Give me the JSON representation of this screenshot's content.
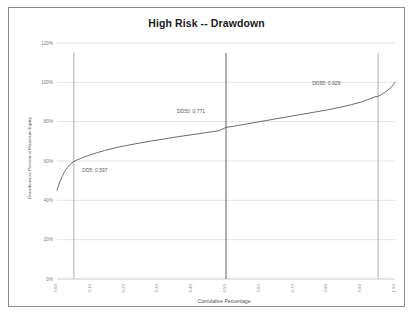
{
  "chart_data": {
    "type": "line",
    "title": "High Risk -- Drawdown",
    "xlabel": "Cumulative Percentage",
    "ylabel": "Drawdown as Percent of Maximum Equity",
    "xlim": [
      0.0,
      1.0
    ],
    "ylim": [
      0.0,
      1.2
    ],
    "grid": true,
    "legend": false,
    "xticks": [
      "0.00",
      "0.10",
      "0.20",
      "0.30",
      "0.40",
      "0.50",
      "0.60",
      "0.70",
      "0.80",
      "0.90",
      "1.00"
    ],
    "xtick_values": [
      0.0,
      0.1,
      0.2,
      0.3,
      0.4,
      0.5,
      0.6,
      0.7,
      0.8,
      0.9,
      1.0
    ],
    "yticks": [
      "0%",
      "20%",
      "40%",
      "60%",
      "80%",
      "100%",
      "120%"
    ],
    "ytick_values": [
      0.0,
      0.2,
      0.4,
      0.6,
      0.8,
      1.0,
      1.2
    ],
    "series": [
      {
        "name": "Drawdown distribution",
        "x": [
          0.0,
          0.005,
          0.01,
          0.015,
          0.02,
          0.025,
          0.03,
          0.035,
          0.04,
          0.05,
          0.06,
          0.07,
          0.08,
          0.09,
          0.1,
          0.12,
          0.14,
          0.16,
          0.18,
          0.2,
          0.24,
          0.28,
          0.32,
          0.36,
          0.4,
          0.44,
          0.48,
          0.5,
          0.52,
          0.56,
          0.6,
          0.64,
          0.68,
          0.72,
          0.76,
          0.8,
          0.84,
          0.87,
          0.9,
          0.92,
          0.94,
          0.95,
          0.96,
          0.97,
          0.98,
          0.99,
          0.995,
          1.0
        ],
        "y": [
          0.452,
          0.478,
          0.5,
          0.52,
          0.538,
          0.552,
          0.565,
          0.576,
          0.585,
          0.597,
          0.606,
          0.613,
          0.62,
          0.626,
          0.632,
          0.643,
          0.653,
          0.662,
          0.67,
          0.677,
          0.69,
          0.702,
          0.713,
          0.724,
          0.734,
          0.744,
          0.754,
          0.771,
          0.776,
          0.788,
          0.8,
          0.812,
          0.824,
          0.836,
          0.848,
          0.86,
          0.874,
          0.886,
          0.9,
          0.912,
          0.926,
          0.929,
          0.938,
          0.949,
          0.962,
          0.978,
          0.988,
          1.0
        ]
      }
    ],
    "reference_lines": [
      {
        "name": "DD5",
        "x": 0.05,
        "style": "thin"
      },
      {
        "name": "DD50",
        "x": 0.5,
        "style": "thick"
      },
      {
        "name": "DD95",
        "x": 0.95,
        "style": "thin"
      }
    ],
    "annotations": [
      {
        "name": "dd5-label",
        "text": "DD5: 0.597",
        "x": 0.075,
        "y": 0.545
      },
      {
        "name": "dd50-label",
        "text": "DD50: 0.771",
        "x": 0.355,
        "y": 0.845
      },
      {
        "name": "dd95-label",
        "text": "DD95: 0.929",
        "x": 0.755,
        "y": 0.985
      }
    ]
  }
}
